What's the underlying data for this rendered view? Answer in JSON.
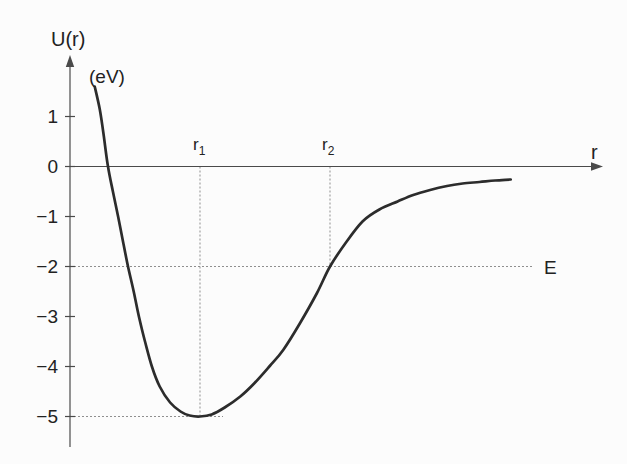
{
  "figure": {
    "background": "#fcfcfc",
    "curve_color": "#2c2c2c",
    "axis_color": "#4a4a4a",
    "guide_color": "#8f8f8f",
    "text_color": "#222222"
  },
  "labels": {
    "y_axis_title": "U(r)",
    "y_axis_units": "(eV)",
    "x_axis_title": "r",
    "r1": {
      "base": "r",
      "sub": "1"
    },
    "r2": {
      "base": "r",
      "sub": "2"
    },
    "energy": "E",
    "y_tick_labels": [
      "1",
      "0",
      "−1",
      "−2",
      "−3",
      "−4",
      "−5"
    ]
  },
  "chart_data": {
    "type": "line",
    "title": "",
    "xlabel": "r",
    "ylabel": "U(r) (eV)",
    "x_units": "multiples of r1 (no numeric x ticks shown)",
    "xlim": [
      0,
      4.1
    ],
    "ylim": [
      -5.6,
      1.7
    ],
    "y_ticks": [
      1,
      0,
      -1,
      -2,
      -3,
      -4,
      -5
    ],
    "grid": false,
    "legend": "none",
    "series": [
      {
        "name": "U(r)",
        "points": [
          [
            0.19,
            1.6
          ],
          [
            0.23,
            1.13
          ],
          [
            0.26,
            0.61
          ],
          [
            0.292,
            0.0
          ],
          [
            0.33,
            -0.5
          ],
          [
            0.37,
            -1.0
          ],
          [
            0.408,
            -1.5
          ],
          [
            0.446,
            -2.0
          ],
          [
            0.49,
            -2.5
          ],
          [
            0.53,
            -3.0
          ],
          [
            0.577,
            -3.5
          ],
          [
            0.63,
            -4.0
          ],
          [
            0.69,
            -4.4
          ],
          [
            0.77,
            -4.72
          ],
          [
            0.85,
            -4.9
          ],
          [
            0.92,
            -4.98
          ],
          [
            1.0,
            -5.0
          ],
          [
            1.09,
            -4.96
          ],
          [
            1.19,
            -4.82
          ],
          [
            1.31,
            -4.6
          ],
          [
            1.42,
            -4.33
          ],
          [
            1.54,
            -3.98
          ],
          [
            1.64,
            -3.67
          ],
          [
            1.77,
            -3.13
          ],
          [
            1.9,
            -2.53
          ],
          [
            2.0,
            -2.0
          ],
          [
            2.12,
            -1.53
          ],
          [
            2.25,
            -1.1
          ],
          [
            2.38,
            -0.86
          ],
          [
            2.52,
            -0.7
          ],
          [
            2.64,
            -0.57
          ],
          [
            2.77,
            -0.47
          ],
          [
            2.9,
            -0.39
          ],
          [
            3.02,
            -0.34
          ],
          [
            3.15,
            -0.31
          ],
          [
            3.27,
            -0.28
          ],
          [
            3.39,
            -0.26
          ]
        ]
      }
    ],
    "markers": {
      "r1": {
        "x": 1.0,
        "u": -5.0
      },
      "r2": {
        "x": 2.0,
        "u": -2.0
      },
      "energy_level": -2.0,
      "u_min": -5.0,
      "asymptote_u": -0.25
    }
  }
}
